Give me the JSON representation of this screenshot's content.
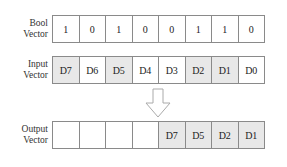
{
  "rows": {
    "bool": {
      "label_line1": "Bool",
      "label_line2": "Vector",
      "cells": [
        {
          "text": "1",
          "selected": false
        },
        {
          "text": "0",
          "selected": false
        },
        {
          "text": "1",
          "selected": false
        },
        {
          "text": "0",
          "selected": false
        },
        {
          "text": "0",
          "selected": false
        },
        {
          "text": "1",
          "selected": false
        },
        {
          "text": "1",
          "selected": false
        },
        {
          "text": "0",
          "selected": false
        }
      ]
    },
    "input": {
      "label_line1": "Input",
      "label_line2": "Vector",
      "cells": [
        {
          "text": "D7",
          "selected": true
        },
        {
          "text": "D6",
          "selected": false
        },
        {
          "text": "D5",
          "selected": true
        },
        {
          "text": "D4",
          "selected": false
        },
        {
          "text": "D3",
          "selected": false
        },
        {
          "text": "D2",
          "selected": true
        },
        {
          "text": "D1",
          "selected": true
        },
        {
          "text": "D0",
          "selected": false
        }
      ]
    },
    "output": {
      "label_line1": "Output",
      "label_line2": "Vector",
      "cells": [
        {
          "text": "",
          "selected": false
        },
        {
          "text": "",
          "selected": false
        },
        {
          "text": "",
          "selected": false
        },
        {
          "text": "",
          "selected": false
        },
        {
          "text": "D7",
          "selected": true
        },
        {
          "text": "D5",
          "selected": true
        },
        {
          "text": "D2",
          "selected": true
        },
        {
          "text": "D1",
          "selected": true
        }
      ]
    }
  },
  "arrow": {
    "icon": "down-arrow-icon",
    "stroke": "#aaaaaa"
  },
  "colors": {
    "selected_fill": "#e8e8e8",
    "border": "#8a8a8a"
  }
}
